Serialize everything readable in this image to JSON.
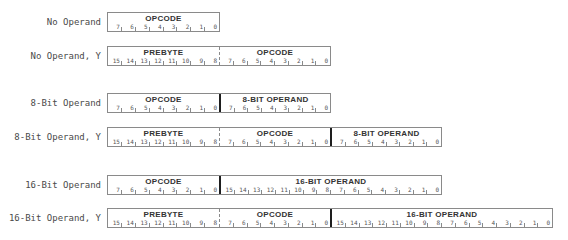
{
  "rows": [
    {
      "label": "No Operand",
      "fields": [
        {
          "title": "OPCODE",
          "divider": "none",
          "bits": [
            "7",
            "6",
            "5",
            "4",
            "3",
            "2",
            "1",
            "0"
          ]
        }
      ]
    },
    {
      "label": "No Operand, Y",
      "fields": [
        {
          "title": "PREBYTE",
          "divider": "none",
          "bits": [
            "15",
            "14",
            "13",
            "12",
            "11",
            "10",
            "9",
            "8"
          ]
        },
        {
          "title": "OPCODE",
          "divider": "dashed",
          "bits": [
            "7",
            "6",
            "5",
            "4",
            "3",
            "2",
            "1",
            "0"
          ]
        }
      ]
    },
    {
      "label": "8-Bit Operand",
      "fields": [
        {
          "title": "OPCODE",
          "divider": "none",
          "bits": [
            "7",
            "6",
            "5",
            "4",
            "3",
            "2",
            "1",
            "0"
          ]
        },
        {
          "title": "8-BIT OPERAND",
          "divider": "solid",
          "bits": [
            "7",
            "6",
            "5",
            "4",
            "3",
            "2",
            "1",
            "0"
          ]
        }
      ]
    },
    {
      "label": "8-Bit Operand, Y",
      "fields": [
        {
          "title": "PREBYTE",
          "divider": "none",
          "bits": [
            "15",
            "14",
            "13",
            "12",
            "11",
            "10",
            "9",
            "8"
          ]
        },
        {
          "title": "OPCODE",
          "divider": "dashed",
          "bits": [
            "7",
            "6",
            "5",
            "4",
            "3",
            "2",
            "1",
            "0"
          ]
        },
        {
          "title": "8-BIT OPERAND",
          "divider": "solid",
          "bits": [
            "7",
            "6",
            "5",
            "4",
            "3",
            "2",
            "1",
            "0"
          ]
        }
      ]
    },
    {
      "label": "16-Bit Operand",
      "fields": [
        {
          "title": "OPCODE",
          "divider": "none",
          "bits": [
            "7",
            "6",
            "5",
            "4",
            "3",
            "2",
            "1",
            "0"
          ]
        },
        {
          "title": "16-BIT OPERAND",
          "divider": "solid",
          "bits": [
            "15",
            "14",
            "13",
            "12",
            "11",
            "10",
            "9",
            "8",
            "7",
            "6",
            "5",
            "4",
            "3",
            "2",
            "1",
            "0"
          ]
        }
      ]
    },
    {
      "label": "16-Bit Operand, Y",
      "fields": [
        {
          "title": "PREBYTE",
          "divider": "none",
          "bits": [
            "15",
            "14",
            "13",
            "12",
            "11",
            "10",
            "9",
            "8"
          ]
        },
        {
          "title": "OPCODE",
          "divider": "dashed",
          "bits": [
            "7",
            "6",
            "5",
            "4",
            "3",
            "2",
            "1",
            "0"
          ]
        },
        {
          "title": "16-BIT OPERAND",
          "divider": "solid",
          "bits": [
            "15",
            "14",
            "13",
            "12",
            "11",
            "10",
            "9",
            "8",
            "7",
            "6",
            "5",
            "4",
            "3",
            "2",
            "1",
            "0"
          ]
        }
      ]
    }
  ]
}
